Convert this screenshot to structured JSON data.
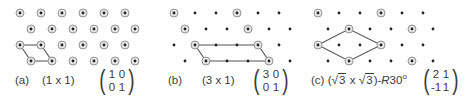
{
  "panels": [
    {
      "id": "a",
      "label": "(a)",
      "notation": "(1 x 1)",
      "matrix": [
        [
          "1",
          "0"
        ],
        [
          "0",
          "1"
        ]
      ],
      "row_y": [
        13,
        29,
        45,
        61
      ],
      "rows": [
        {
          "x": [
            20,
            41,
            62,
            83,
            104,
            125
          ],
          "circled": [
            true,
            true,
            true,
            true,
            true,
            true
          ]
        },
        {
          "x": [
            31,
            52,
            73,
            94,
            115,
            135
          ],
          "circled": [
            true,
            true,
            true,
            true,
            true,
            true
          ]
        },
        {
          "x": [
            20,
            41,
            62,
            83,
            104,
            125
          ],
          "circled": [
            true,
            true,
            true,
            true,
            true,
            true
          ]
        },
        {
          "x": [
            31,
            52,
            73,
            94,
            115,
            135
          ],
          "circled": [
            true,
            true,
            true,
            true,
            true,
            true
          ]
        }
      ],
      "cell_outline": [
        [
          20,
          45
        ],
        [
          41,
          45
        ],
        [
          52,
          61
        ],
        [
          31,
          61
        ]
      ]
    },
    {
      "id": "b",
      "label": "(b)",
      "notation": "(3 x 1)",
      "matrix": [
        [
          "3",
          "0"
        ],
        [
          "0",
          "1"
        ]
      ],
      "row_y": [
        13,
        29,
        45,
        61
      ],
      "rows": [
        {
          "x": [
            174,
            195,
            216,
            237,
            258,
            279
          ],
          "circled": [
            true,
            false,
            false,
            true,
            false,
            false
          ]
        },
        {
          "x": [
            185,
            206,
            227,
            248,
            269,
            290
          ],
          "circled": [
            true,
            false,
            false,
            true,
            false,
            false
          ]
        },
        {
          "x": [
            174,
            195,
            216,
            237,
            258,
            279
          ],
          "circled": [
            false,
            true,
            false,
            false,
            true,
            false
          ]
        },
        {
          "x": [
            185,
            206,
            227,
            248,
            269,
            290
          ],
          "circled": [
            false,
            false,
            false,
            false,
            false,
            false
          ]
        }
      ],
      "extra_circled": [
        [
          206,
          61
        ],
        [
          269,
          61
        ]
      ],
      "cell_outline": [
        [
          195,
          45
        ],
        [
          258,
          45
        ],
        [
          269,
          61
        ],
        [
          206,
          61
        ]
      ]
    },
    {
      "id": "c",
      "label": "(c)",
      "notation_prefix": "(",
      "sqrt_a": "3",
      "times": "x",
      "sqrt_b": "3",
      "notation_suffix": ")-",
      "rotation_symbol": "R",
      "rotation_angle": "30",
      "degree": "o",
      "matrix": [
        [
          "2",
          "1"
        ],
        [
          "-1",
          "1"
        ]
      ],
      "row_y": [
        13,
        29,
        45,
        61
      ],
      "rows": [
        {
          "x": [
            318,
            339,
            360,
            381,
            402,
            423
          ],
          "circled": [
            true,
            false,
            false,
            true,
            false,
            false
          ]
        },
        {
          "x": [
            328,
            349,
            370,
            391,
            412,
            433
          ],
          "circled": [
            false,
            true,
            false,
            false,
            true,
            false
          ]
        },
        {
          "x": [
            318,
            339,
            360,
            381,
            402,
            423
          ],
          "circled": [
            true,
            false,
            false,
            true,
            false,
            false
          ]
        },
        {
          "x": [
            328,
            349,
            370,
            391,
            412,
            433
          ],
          "circled": [
            false,
            true,
            false,
            false,
            true,
            false
          ]
        }
      ],
      "cell_outline": [
        [
          318,
          45
        ],
        [
          349,
          29
        ],
        [
          381,
          45
        ],
        [
          349,
          61
        ]
      ]
    }
  ],
  "colors": {
    "atom": "#222222",
    "ring_fill": "#e6e6e6",
    "ring_stroke": "#8a8a8a",
    "cell_line": "#555555"
  }
}
